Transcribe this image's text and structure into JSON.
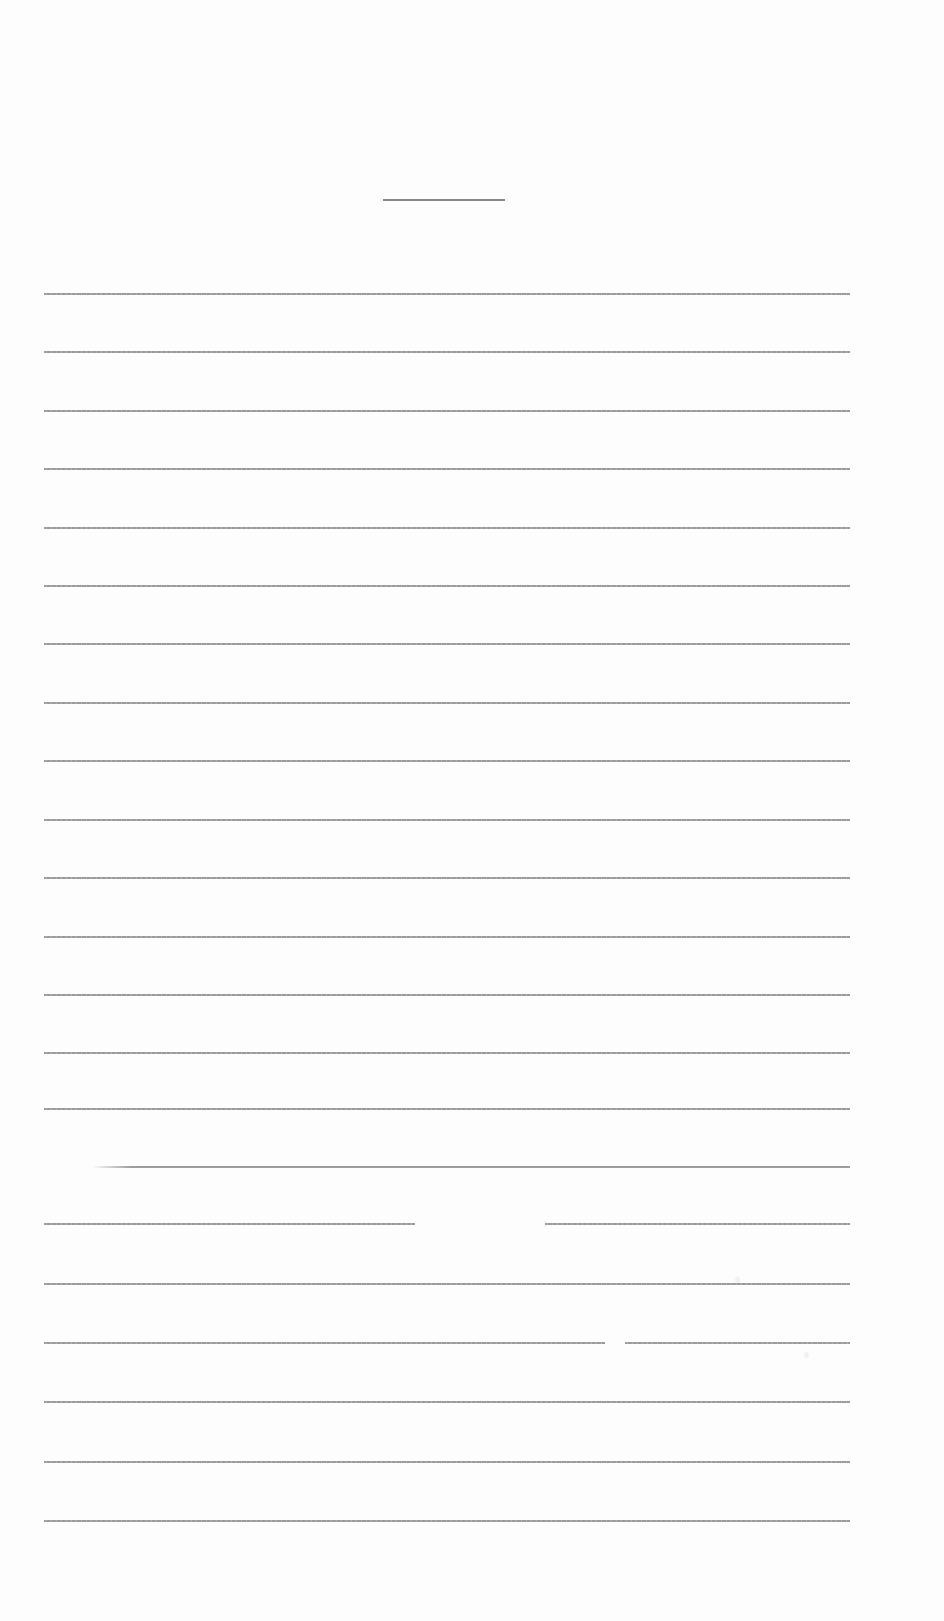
{
  "document": {
    "type": "blank lined page (scanned)",
    "background_color": "#fdfdfd",
    "rule_color": "#8c8c8c",
    "title_rule": {
      "x1": 383,
      "x2": 505,
      "y": 199
    },
    "line_left": 44,
    "line_right": 850,
    "lines": [
      {
        "y": 293
      },
      {
        "y": 351
      },
      {
        "y": 410
      },
      {
        "y": 468
      },
      {
        "y": 527
      },
      {
        "y": 585
      },
      {
        "y": 643
      },
      {
        "y": 702
      },
      {
        "y": 760
      },
      {
        "y": 819
      },
      {
        "y": 877
      },
      {
        "y": 936
      },
      {
        "y": 994
      },
      {
        "y": 1052
      },
      {
        "y": 1108
      },
      {
        "y": 1166,
        "x1": 92
      },
      {
        "y": 1223,
        "gap": [
          415,
          545
        ]
      },
      {
        "y": 1283
      },
      {
        "y": 1342,
        "gap": [
          605,
          625
        ]
      },
      {
        "y": 1401
      },
      {
        "y": 1461
      },
      {
        "y": 1520
      }
    ]
  }
}
